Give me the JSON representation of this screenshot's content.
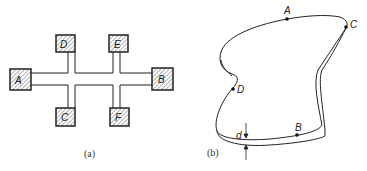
{
  "figure_a": {
    "caption": "(a)",
    "pads": [
      {
        "id": "A",
        "label": "A"
      },
      {
        "id": "B",
        "label": "B"
      },
      {
        "id": "C",
        "label": "C"
      },
      {
        "id": "D",
        "label": "D"
      },
      {
        "id": "E",
        "label": "E"
      },
      {
        "id": "F",
        "label": "F"
      }
    ]
  },
  "figure_b": {
    "caption": "(b)",
    "points": [
      {
        "id": "A",
        "label": "A"
      },
      {
        "id": "B",
        "label": "B"
      },
      {
        "id": "C",
        "label": "C"
      },
      {
        "id": "D",
        "label": "D"
      }
    ],
    "thickness_label": "d"
  },
  "colors": {
    "stroke": "#222222",
    "hatch": "#555555",
    "background": "#ffffff"
  }
}
